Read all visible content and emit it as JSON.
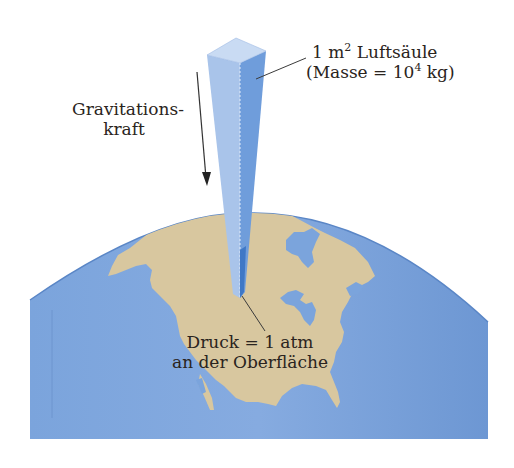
{
  "diagram": {
    "column_label": {
      "line1_prefix": "1 m",
      "line1_sup": "2",
      "line1_suffix": " Luftsäule",
      "line2_prefix": "(Masse = 10",
      "line2_sup": "4",
      "line2_suffix": " kg)"
    },
    "gravity_label": {
      "line1": "Gravitations-",
      "line2": "kraft"
    },
    "pressure_label": {
      "line1": "Druck = 1 atm",
      "line2": "an der Oberfläche"
    },
    "colors": {
      "ocean": "#6f9ad6",
      "ocean_light": "#8fb3e3",
      "land": "#d8c79f",
      "column_light": "#a9c4ea",
      "column_dark": "#5b8fd4",
      "column_top": "#c9dbf3",
      "text": "#2a2420"
    }
  }
}
